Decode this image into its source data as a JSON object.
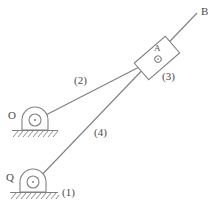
{
  "figure": {
    "title": "",
    "type": "mechanism-kinematic-diagram",
    "background_color": "#ffffff",
    "line_color": "#808080",
    "text_color": "#4a4a4a"
  },
  "points": [
    {
      "id": "O",
      "label": "O",
      "x": 35,
      "y": 120,
      "kind": "fixed-pivot"
    },
    {
      "id": "Q",
      "label": "Q",
      "x": 33,
      "y": 182,
      "kind": "fixed-pivot"
    },
    {
      "id": "A",
      "label": "A",
      "x": 157,
      "y": 53,
      "kind": "pin-joint"
    },
    {
      "id": "B",
      "label": "B",
      "x": 197,
      "y": 13,
      "kind": "line-end"
    }
  ],
  "links": [
    {
      "id": "1",
      "label": "(1)",
      "name": "ground",
      "label_x": 62,
      "label_y": 192
    },
    {
      "id": "2",
      "label": "(2)",
      "name": "link-O-to-A",
      "label_x": 74,
      "label_y": 80,
      "from": "O",
      "to": "A"
    },
    {
      "id": "3",
      "label": "(3)",
      "name": "slider-block",
      "label_x": 162,
      "label_y": 76
    },
    {
      "id": "4",
      "label": "(4)",
      "name": "link-Q-to-B",
      "label_x": 94,
      "label_y": 132,
      "from": "Q",
      "to": "B"
    }
  ],
  "lines": [
    {
      "name": "link-2-line",
      "x1": 38,
      "y1": 119,
      "x2": 148,
      "y2": 62
    },
    {
      "name": "link-4-line",
      "x1": 36,
      "y1": 181,
      "x2": 197,
      "y2": 13
    }
  ],
  "block": {
    "name": "slider-block-3",
    "center_x": 157,
    "center_y": 58,
    "width": 41,
    "height": 22,
    "rotation_deg": -41,
    "pin_x": 157,
    "pin_y": 58,
    "pin_r": 3.2,
    "label": "A"
  },
  "supports": [
    {
      "name": "support-O",
      "pivot_x": 35,
      "pivot_y": 120,
      "body_left": 22,
      "body_right": 48,
      "body_top": 108,
      "body_bottom": 130,
      "ground_y": 130,
      "ground_x1": 12,
      "ground_x2": 58,
      "hatch_depth": 6,
      "label": "O",
      "label_x": 10,
      "label_y": 114
    },
    {
      "name": "support-Q",
      "pivot_x": 33,
      "pivot_y": 182,
      "body_left": 20,
      "body_right": 46,
      "body_top": 170,
      "body_bottom": 192,
      "ground_y": 192,
      "ground_x1": 10,
      "ground_x2": 58,
      "hatch_depth": 6,
      "label": "Q",
      "label_x": 8,
      "label_y": 176
    }
  ]
}
